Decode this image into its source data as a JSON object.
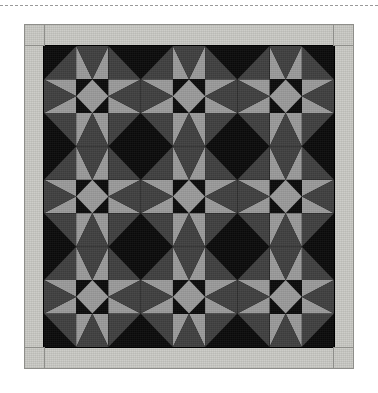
{
  "page": {
    "background": "#ffffff",
    "width": 378,
    "height": 393
  },
  "top_rule": {
    "style": "dashed",
    "color": "#9a9a9a"
  },
  "quilt": {
    "title": "Star Block Quilt",
    "palette": {
      "black": "#0a0a0a",
      "dark_gray": "#3f3f3f",
      "light_gray": "#9a9a9a",
      "border": "#c9c9c4",
      "seam": "#8e8e8a"
    },
    "border": {
      "name": "outer-border",
      "width_px": 19,
      "color": "#c9c9c4",
      "corner_squares": 4
    },
    "layout": {
      "blocks_across": 3,
      "blocks_down": 3,
      "units_per_block": 3,
      "total_units_across": 9,
      "total_units_down": 9
    },
    "block": {
      "name": "eight-pointed-star",
      "corner_unit": "half-square-triangle",
      "edge_unit": "flying-geese",
      "center_unit": "square-on-point"
    },
    "unit_grid": [
      [
        "corner-tl",
        "geese-up",
        "corner-tr",
        "corner-tl",
        "geese-up",
        "corner-tr",
        "corner-tl",
        "geese-up",
        "corner-tr"
      ],
      [
        "geese-left",
        "center",
        "geese-right",
        "geese-left",
        "center",
        "geese-right",
        "geese-left",
        "center",
        "geese-right"
      ],
      [
        "corner-bl",
        "geese-down",
        "corner-br",
        "corner-bl",
        "geese-down",
        "corner-br",
        "corner-bl",
        "geese-down",
        "corner-br"
      ],
      [
        "corner-tl",
        "geese-up",
        "corner-tr",
        "corner-tl",
        "geese-up",
        "corner-tr",
        "corner-tl",
        "geese-up",
        "corner-tr"
      ],
      [
        "geese-left",
        "center",
        "geese-right",
        "geese-left",
        "center",
        "geese-right",
        "geese-left",
        "center",
        "geese-right"
      ],
      [
        "corner-bl",
        "geese-down",
        "corner-br",
        "corner-bl",
        "geese-down",
        "corner-br",
        "corner-bl",
        "geese-down",
        "corner-br"
      ],
      [
        "corner-tl",
        "geese-up",
        "corner-tr",
        "corner-tl",
        "geese-up",
        "corner-tr",
        "corner-tl",
        "geese-up",
        "corner-tr"
      ],
      [
        "geese-left",
        "center",
        "geese-right",
        "geese-left",
        "center",
        "geese-right",
        "geese-left",
        "center",
        "geese-right"
      ],
      [
        "corner-bl",
        "geese-down",
        "corner-br",
        "corner-bl",
        "geese-down",
        "corner-br",
        "corner-bl",
        "geese-down",
        "corner-br"
      ]
    ]
  }
}
